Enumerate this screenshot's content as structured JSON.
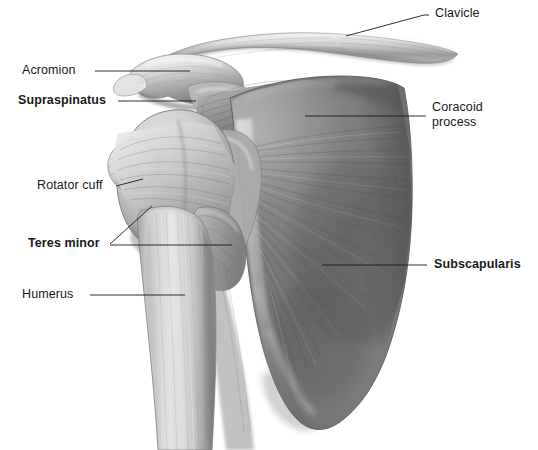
{
  "figure": {
    "background_color": "#ffffff",
    "width": 538,
    "height": 450,
    "style": "grayscale medical illustration",
    "line_color": "#1a1a1a",
    "text_color": "#1a1a1a"
  },
  "labels": [
    {
      "id": "clavicle",
      "text": "Clavicle",
      "bold": false,
      "align": "left",
      "x": 435,
      "y": 6,
      "leader": [
        [
          346,
          36
        ],
        [
          424,
          15
        ],
        [
          429,
          15
        ]
      ]
    },
    {
      "id": "acromion",
      "text": "Acromion",
      "bold": false,
      "align": "left",
      "x": 22,
      "y": 63,
      "leader": [
        [
          95,
          71
        ],
        [
          190,
          71
        ]
      ]
    },
    {
      "id": "supraspinatus",
      "text": "Supraspinatus",
      "bold": true,
      "align": "left",
      "x": 18,
      "y": 93,
      "leader": [
        [
          118,
          101
        ],
        [
          196,
          101
        ]
      ]
    },
    {
      "id": "coracoid-process",
      "text": "Coracoid\nprocess",
      "line1": "Coracoid",
      "line2": "process",
      "bold": false,
      "align": "left",
      "x": 432,
      "y": 100,
      "leader": [
        [
          305,
          116
        ],
        [
          426,
          116
        ]
      ]
    },
    {
      "id": "rotator-cuff",
      "text": "Rotator cuff",
      "bold": false,
      "align": "left",
      "x": 37,
      "y": 178,
      "leader": [
        [
          116,
          186
        ],
        [
          142,
          180
        ]
      ]
    },
    {
      "id": "teres-minor",
      "text": "Teres minor",
      "bold": true,
      "align": "left",
      "x": 28,
      "y": 236,
      "leader_a": [
        [
          110,
          244
        ],
        [
          152,
          206
        ]
      ],
      "leader_b": [
        [
          110,
          245
        ],
        [
          232,
          245
        ]
      ]
    },
    {
      "id": "subscapularis",
      "text": "Subscapularis",
      "bold": true,
      "align": "left",
      "x": 434,
      "y": 257,
      "leader": [
        [
          322,
          265
        ],
        [
          427,
          265
        ]
      ]
    },
    {
      "id": "humerus",
      "text": "Humerus",
      "bold": false,
      "align": "left",
      "x": 22,
      "y": 287,
      "leader": [
        [
          90,
          295
        ],
        [
          185,
          295
        ]
      ]
    }
  ],
  "anatomy_parts": [
    {
      "id": "clavicle-bone",
      "name": "Clavicle",
      "tone": "#c9c9c9"
    },
    {
      "id": "acromion-bone",
      "name": "Acromion",
      "tone": "#d2d2d2"
    },
    {
      "id": "coracoid-bone",
      "name": "Coracoid process",
      "tone": "#d8d8d8"
    },
    {
      "id": "humerus-bone",
      "name": "Humerus",
      "tone": "#bdbdbd"
    },
    {
      "id": "humeral-head",
      "name": "Humeral head",
      "tone": "#c4c4c4"
    },
    {
      "id": "supraspinatus-muscle",
      "name": "Supraspinatus",
      "tone": "#9a9a9a"
    },
    {
      "id": "rotator-cuff-tendon",
      "name": "Rotator cuff",
      "tone": "#c0c0c0"
    },
    {
      "id": "teres-minor-muscle",
      "name": "Teres minor",
      "tone": "#a8a8a8"
    },
    {
      "id": "subscapularis-muscle",
      "name": "Subscapularis",
      "tone": "#7b7b7b"
    },
    {
      "id": "scapula-body",
      "name": "Scapula",
      "tone": "#6f6f6f"
    }
  ]
}
